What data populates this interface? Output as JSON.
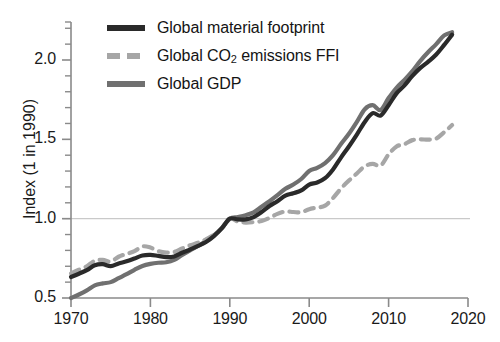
{
  "chart_data": {
    "type": "line",
    "title": "",
    "xlabel": "",
    "ylabel": "Index (1 in 1990)",
    "xlim": [
      1970,
      2020
    ],
    "ylim": [
      0.45,
      2.28
    ],
    "xticks": [
      1970,
      1980,
      1990,
      2000,
      2010,
      2020
    ],
    "xtick_labels": [
      "1970",
      "1980",
      "1990",
      "2000",
      "2010",
      "2020"
    ],
    "yticks": [
      0.5,
      1.0,
      1.5,
      2.0
    ],
    "ytick_labels": [
      "0.5",
      "1.0",
      "1.5",
      "2.0"
    ],
    "y_minor_ticks": [
      0.6,
      0.7,
      0.8,
      0.9,
      1.1,
      1.2,
      1.3,
      1.4,
      1.6,
      1.7,
      1.8,
      1.9,
      2.1,
      2.2
    ],
    "grid": "horizontal gridline at y=1.0 only",
    "legend_position": "top-left inside axes",
    "x": [
      1970,
      1971,
      1972,
      1973,
      1974,
      1975,
      1976,
      1977,
      1978,
      1979,
      1980,
      1981,
      1982,
      1983,
      1984,
      1985,
      1986,
      1987,
      1988,
      1989,
      1990,
      1991,
      1992,
      1993,
      1994,
      1995,
      1996,
      1997,
      1998,
      1999,
      2000,
      2001,
      2002,
      2003,
      2004,
      2005,
      2006,
      2007,
      2008,
      2009,
      2010,
      2011,
      2012,
      2013,
      2014,
      2015,
      2016,
      2017,
      2018
    ],
    "series": [
      {
        "name": "Global material footprint",
        "color": "#2a2a2a",
        "style": "solid",
        "width": 4.2,
        "values": [
          0.632,
          0.653,
          0.675,
          0.706,
          0.713,
          0.701,
          0.718,
          0.731,
          0.749,
          0.768,
          0.772,
          0.765,
          0.758,
          0.762,
          0.785,
          0.806,
          0.828,
          0.853,
          0.89,
          0.94,
          1.0,
          0.995,
          0.996,
          1.01,
          1.042,
          1.08,
          1.11,
          1.145,
          1.16,
          1.178,
          1.215,
          1.228,
          1.255,
          1.31,
          1.385,
          1.455,
          1.53,
          1.61,
          1.665,
          1.65,
          1.715,
          1.79,
          1.84,
          1.9,
          1.95,
          1.99,
          2.035,
          2.095,
          2.16
        ]
      },
      {
        "name": "Global CO2 emissions FFI",
        "color": "#a6a6a6",
        "style": "dashed",
        "width": 4.2,
        "values": [
          0.655,
          0.678,
          0.7,
          0.735,
          0.74,
          0.73,
          0.76,
          0.778,
          0.795,
          0.825,
          0.818,
          0.795,
          0.786,
          0.79,
          0.812,
          0.832,
          0.848,
          0.87,
          0.9,
          0.94,
          1.0,
          0.982,
          0.975,
          0.978,
          0.985,
          1.005,
          1.03,
          1.045,
          1.042,
          1.04,
          1.06,
          1.07,
          1.082,
          1.13,
          1.19,
          1.24,
          1.285,
          1.33,
          1.345,
          1.335,
          1.405,
          1.455,
          1.47,
          1.495,
          1.5,
          1.498,
          1.505,
          1.545,
          1.59
        ]
      },
      {
        "name": "Global GDP",
        "color": "#707070",
        "style": "solid",
        "width": 4.2,
        "values": [
          0.5,
          0.522,
          0.548,
          0.58,
          0.592,
          0.6,
          0.625,
          0.65,
          0.678,
          0.702,
          0.715,
          0.722,
          0.725,
          0.74,
          0.772,
          0.8,
          0.828,
          0.858,
          0.895,
          0.94,
          1.0,
          1.01,
          1.022,
          1.04,
          1.075,
          1.11,
          1.148,
          1.188,
          1.215,
          1.25,
          1.3,
          1.32,
          1.35,
          1.4,
          1.47,
          1.535,
          1.61,
          1.69,
          1.715,
          1.685,
          1.76,
          1.825,
          1.875,
          1.93,
          1.995,
          2.05,
          2.1,
          2.155,
          2.175
        ]
      }
    ]
  },
  "axes": {
    "y_title": "Index (1 in 1990)"
  },
  "legend": {
    "items": [
      {
        "label_prefix": "Global material footprint",
        "label_sub": "",
        "label_suffix": "",
        "swatch": "solid-dark"
      },
      {
        "label_prefix": "Global CO",
        "label_sub": "2",
        "label_suffix": " emissions FFI",
        "swatch": "dashed-gray"
      },
      {
        "label_prefix": "Global GDP",
        "label_sub": "",
        "label_suffix": "",
        "swatch": "solid-midgray"
      }
    ]
  },
  "colors": {
    "material_footprint": "#2a2a2a",
    "co2_emissions": "#a6a6a6",
    "gdp": "#707070",
    "axis": "#8a8a8a",
    "gridline": "#c9c9c9",
    "text": "#1a1a1a"
  }
}
